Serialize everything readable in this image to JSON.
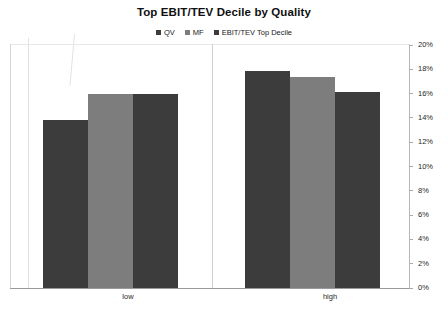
{
  "chart_data": {
    "type": "bar",
    "title": "Top EBIT/TEV Decile by Quality",
    "subtitle": "",
    "xlabel": "",
    "ylabel": "",
    "categories": [
      "low",
      "high"
    ],
    "series": [
      {
        "name": "QV",
        "color": "#3c3c3c",
        "values": [
          13.8,
          17.9
        ]
      },
      {
        "name": "MF",
        "color": "#7d7d7d",
        "values": [
          16.0,
          17.4
        ]
      },
      {
        "name": "EBIT/TEV Top Decile",
        "color": "#3c3c3c",
        "values": [
          16.0,
          16.1
        ]
      }
    ],
    "ylim": [
      0,
      20
    ],
    "ytick_values": [
      0,
      2,
      4,
      6,
      8,
      10,
      12,
      14,
      16,
      18,
      20
    ],
    "ytick_labels": [
      "0%",
      "2%",
      "4%",
      "6%",
      "8%",
      "10%",
      "12%",
      "14%",
      "16%",
      "18%",
      "20%"
    ],
    "yaxis_position": "right",
    "grid": false,
    "legend_position": "top-center",
    "value_format": "percent"
  },
  "legend": {
    "items": [
      {
        "label": "QV",
        "color": "#3c3c3c"
      },
      {
        "label": "MF",
        "color": "#7d7d7d"
      },
      {
        "label": "EBIT/TEV Top Decile",
        "color": "#3c3c3c"
      }
    ]
  },
  "colors": {
    "background": "#ffffff",
    "series_dark": "#3c3c3c",
    "series_mid": "#7d7d7d",
    "axis_line": "#9a9a9a",
    "tick_line": "#a8a8a8",
    "text": "#1f1f1f"
  }
}
